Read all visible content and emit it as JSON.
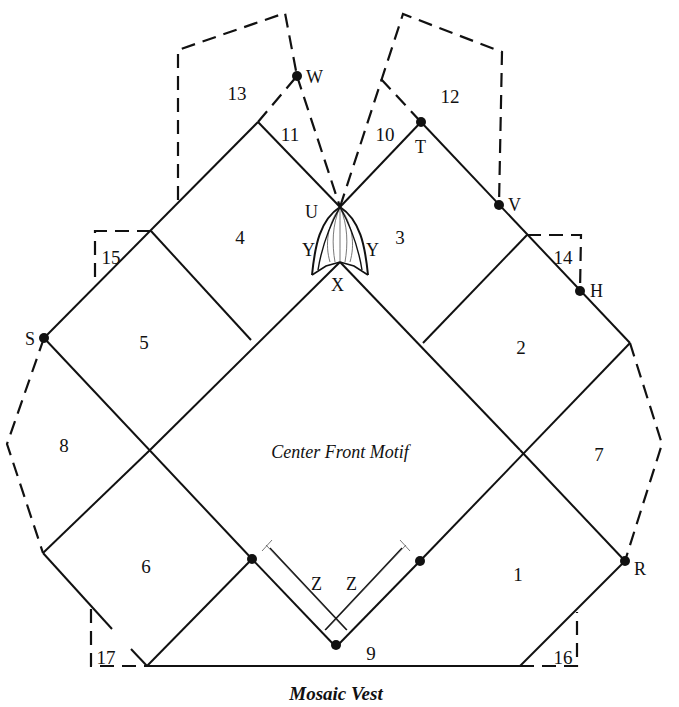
{
  "diagram": {
    "title_cutoff": "",
    "caption": "Mosaic Vest",
    "center_label": "Center Front Motif",
    "panels": [
      {
        "id": "1",
        "x": 518,
        "y": 574
      },
      {
        "id": "2",
        "x": 521,
        "y": 348
      },
      {
        "id": "3",
        "x": 400,
        "y": 237
      },
      {
        "id": "4",
        "x": 240,
        "y": 238
      },
      {
        "id": "5",
        "x": 144,
        "y": 342
      },
      {
        "id": "6",
        "x": 146,
        "y": 566
      },
      {
        "id": "7",
        "x": 599,
        "y": 455
      },
      {
        "id": "8",
        "x": 64,
        "y": 446
      },
      {
        "id": "9",
        "x": 371,
        "y": 654
      },
      {
        "id": "10",
        "x": 385,
        "y": 135
      },
      {
        "id": "11",
        "x": 290,
        "y": 135
      },
      {
        "id": "12",
        "x": 450,
        "y": 97
      },
      {
        "id": "13",
        "x": 237,
        "y": 94
      },
      {
        "id": "14",
        "x": 563,
        "y": 258
      },
      {
        "id": "15",
        "x": 111,
        "y": 258
      },
      {
        "id": "16",
        "x": 563,
        "y": 658
      },
      {
        "id": "17",
        "x": 106,
        "y": 658
      }
    ],
    "points": [
      {
        "id": "S",
        "x": 44,
        "y": 338,
        "dot": true,
        "lx": 25,
        "ly": 345
      },
      {
        "id": "W",
        "x": 297,
        "y": 76,
        "dot": true,
        "lx": 308,
        "ly": 82
      },
      {
        "id": "T",
        "x": 421,
        "y": 122,
        "dot": true,
        "lx": 415,
        "ly": 152
      },
      {
        "id": "V",
        "x": 499,
        "y": 205,
        "dot": true,
        "lx": 509,
        "ly": 211
      },
      {
        "id": "H",
        "x": 580,
        "y": 291,
        "dot": true,
        "lx": 590,
        "ly": 297
      },
      {
        "id": "R",
        "x": 625,
        "y": 561,
        "dot": true,
        "lx": 634,
        "ly": 574
      },
      {
        "id": "U",
        "x": 340,
        "y": 207,
        "dot": false,
        "lx": 306,
        "ly": 217
      },
      {
        "id": "Y",
        "x": 0,
        "y": 0,
        "dot": false,
        "lx": 302,
        "ly": 255
      },
      {
        "id": "Y",
        "x": 0,
        "y": 0,
        "dot": false,
        "lx": 365,
        "ly": 255
      },
      {
        "id": "X",
        "x": 340,
        "y": 262,
        "dot": false,
        "lx": 331,
        "ly": 290
      },
      {
        "id": "Z",
        "x": 0,
        "y": 0,
        "dot": false,
        "lx": 313,
        "ly": 590
      },
      {
        "id": "Z",
        "x": 0,
        "y": 0,
        "dot": false,
        "lx": 348,
        "ly": 590
      }
    ],
    "labels": {
      "p1": "1",
      "p2": "2",
      "p3": "3",
      "p4": "4",
      "p5": "5",
      "p6": "6",
      "p7": "7",
      "p8": "8",
      "p9": "9",
      "p10": "10",
      "p11": "11",
      "p12": "12",
      "p13": "13",
      "p14": "14",
      "p15": "15",
      "p16": "16",
      "p17": "17",
      "S": "S",
      "W": "W",
      "T": "T",
      "V": "V",
      "H": "H",
      "R": "R",
      "U": "U",
      "Y": "Y",
      "X": "X",
      "Z": "Z"
    }
  }
}
